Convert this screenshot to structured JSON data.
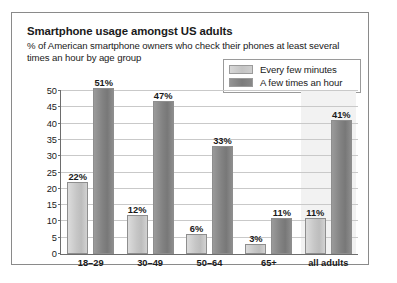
{
  "chart_data": {
    "type": "bar",
    "title": "Smartphone usage amongst US adults",
    "subtitle": "% of American smartphone owners who check their phones at least several times an hour by age group",
    "categories": [
      "18–29",
      "30–49",
      "50–64",
      "65+",
      "all adults"
    ],
    "series": [
      {
        "name": "Every few minutes",
        "color": "#c6c6c6",
        "values": [
          22,
          12,
          6,
          3,
          11
        ],
        "labels": [
          "22%",
          "12%",
          "6%",
          "3%",
          "11%"
        ]
      },
      {
        "name": "A few times an hour",
        "color": "#828282",
        "values": [
          51,
          47,
          33,
          11,
          41
        ],
        "labels": [
          "51%",
          "47%",
          "33%",
          "11%",
          "41%"
        ]
      }
    ],
    "xlabel": "",
    "ylabel": "",
    "ylim": [
      0,
      50
    ],
    "yticks": [
      0,
      5,
      10,
      15,
      20,
      25,
      30,
      35,
      40,
      45,
      50
    ],
    "ytick_labels": [
      "0",
      "5",
      "10",
      "15",
      "20",
      "25",
      "30",
      "35",
      "40",
      "45",
      "50"
    ],
    "grid": true,
    "legend_position": "top-right",
    "highlight_band_category": "all adults"
  },
  "legend": {
    "items": [
      {
        "label": "Every few minutes",
        "swatch": "light"
      },
      {
        "label": "A few times an hour",
        "swatch": "dark"
      }
    ]
  }
}
